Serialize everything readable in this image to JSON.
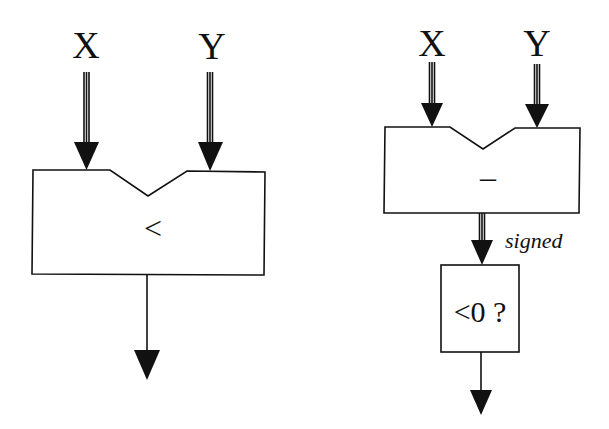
{
  "left_diagram": {
    "input_x_label": "X",
    "input_y_label": "Y",
    "operator": "<"
  },
  "right_diagram": {
    "input_x_label": "X",
    "input_y_label": "Y",
    "subtract_operator": "–",
    "bus_annotation": "signed",
    "test_operator": "<0 ?"
  },
  "colors": {
    "stroke": "#111111",
    "background": "#ffffff"
  }
}
